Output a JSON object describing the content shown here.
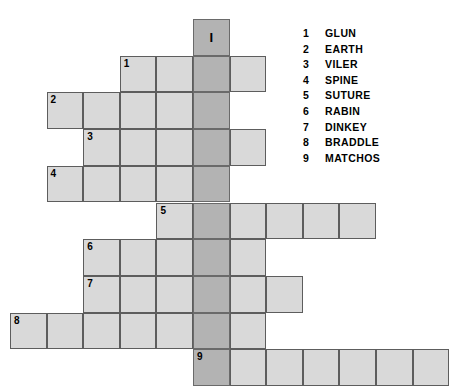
{
  "puzzle": {
    "key_letter": "I",
    "grid": {
      "origin_x": 10,
      "origin_y": 19,
      "cell_w": 36.6,
      "cell_h": 36.7,
      "shaded_col": 5,
      "shaded_row_start": 0,
      "shaded_row_end": 9,
      "colors": {
        "cell_fill": "#d9d9d9",
        "shaded_fill": "#b3b3b3",
        "cell_border": "#5d5d5d",
        "background": "#ffffff",
        "text": "#000000"
      }
    },
    "rows": [
      {
        "number": "1",
        "row": 1,
        "start_col": 3,
        "length": 4
      },
      {
        "number": "2",
        "row": 2,
        "start_col": 1,
        "length": 5
      },
      {
        "number": "3",
        "row": 3,
        "start_col": 2,
        "length": 5
      },
      {
        "number": "4",
        "row": 4,
        "start_col": 1,
        "length": 5
      },
      {
        "number": "5",
        "row": 5,
        "start_col": 4,
        "length": 6
      },
      {
        "number": "6",
        "row": 6,
        "start_col": 2,
        "length": 5
      },
      {
        "number": "7",
        "row": 7,
        "start_col": 2,
        "length": 6
      },
      {
        "number": "8",
        "row": 8,
        "start_col": 0,
        "length": 7
      },
      {
        "number": "9",
        "row": 9,
        "start_col": 5,
        "length": 7
      }
    ]
  },
  "word_list": {
    "items": [
      {
        "number": "1",
        "word": "GLUN"
      },
      {
        "number": "2",
        "word": "EARTH"
      },
      {
        "number": "3",
        "word": "VILER"
      },
      {
        "number": "4",
        "word": "SPINE"
      },
      {
        "number": "5",
        "word": "SUTURE"
      },
      {
        "number": "6",
        "word": "RABIN"
      },
      {
        "number": "7",
        "word": "DINKEY"
      },
      {
        "number": "8",
        "word": "BRADDLE"
      },
      {
        "number": "9",
        "word": "MATCHOS"
      }
    ]
  }
}
